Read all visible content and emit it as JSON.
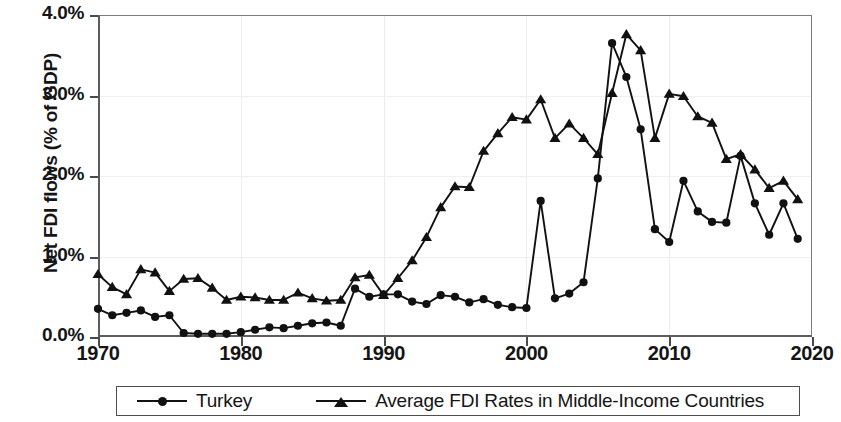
{
  "chart_data": {
    "type": "line",
    "title": "",
    "xlabel": "",
    "ylabel": "Net FDI flows (% of GDP)",
    "xlim": [
      1970,
      2020
    ],
    "ylim": [
      0.0,
      4.0
    ],
    "grid": true,
    "legend_position": "bottom",
    "y_tick_labels": [
      "0.0%",
      "1.0%",
      "2.0%",
      "3.0%",
      "4.0%"
    ],
    "y_ticks": [
      0.0,
      1.0,
      2.0,
      3.0,
      4.0
    ],
    "x_tick_labels": [
      "1970",
      "1980",
      "1990",
      "2000",
      "2010",
      "2020"
    ],
    "x_ticks": [
      1970,
      1980,
      1990,
      2000,
      2010,
      2020
    ],
    "x": [
      1970,
      1971,
      1972,
      1973,
      1974,
      1975,
      1976,
      1977,
      1978,
      1979,
      1980,
      1981,
      1982,
      1983,
      1984,
      1985,
      1986,
      1987,
      1988,
      1989,
      1990,
      1991,
      1992,
      1993,
      1994,
      1995,
      1996,
      1997,
      1998,
      1999,
      2000,
      2001,
      2002,
      2003,
      2004,
      2005,
      2006,
      2007,
      2008,
      2009,
      2010,
      2011,
      2012,
      2013,
      2014,
      2015,
      2016,
      2017,
      2018,
      2019
    ],
    "series": [
      {
        "name": "Turkey",
        "marker": "circle",
        "color": "#111111",
        "values": [
          0.35,
          0.27,
          0.3,
          0.33,
          0.25,
          0.27,
          0.05,
          0.04,
          0.04,
          0.04,
          0.06,
          0.09,
          0.12,
          0.11,
          0.14,
          0.17,
          0.18,
          0.14,
          0.6,
          0.5,
          0.53,
          0.53,
          0.44,
          0.41,
          0.52,
          0.5,
          0.43,
          0.47,
          0.4,
          0.37,
          0.36,
          1.69,
          0.48,
          0.54,
          0.68,
          1.97,
          3.65,
          3.23,
          2.58,
          1.34,
          1.18,
          1.94,
          1.56,
          1.43,
          1.42,
          2.25,
          1.66,
          1.27,
          1.66,
          1.22
        ]
      },
      {
        "name": "Average FDI Rates in Middle-Income Countries",
        "marker": "triangle",
        "color": "#111111",
        "values": [
          0.78,
          0.62,
          0.53,
          0.84,
          0.8,
          0.57,
          0.72,
          0.73,
          0.61,
          0.46,
          0.5,
          0.49,
          0.46,
          0.46,
          0.55,
          0.48,
          0.45,
          0.46,
          0.74,
          0.77,
          0.52,
          0.73,
          0.95,
          1.24,
          1.61,
          1.87,
          1.86,
          2.31,
          2.53,
          2.73,
          2.7,
          2.95,
          2.47,
          2.65,
          2.47,
          2.27,
          3.03,
          3.76,
          3.56,
          2.47,
          3.02,
          2.99,
          2.74,
          2.66,
          2.21,
          2.27,
          2.08,
          1.85,
          1.94,
          1.71
        ]
      }
    ]
  },
  "axis": {
    "y_title": "Net FDI flows (% of GDP)"
  },
  "legend": {
    "items": [
      {
        "label": "Turkey",
        "marker": "circle-marker-icon"
      },
      {
        "label": "Average FDI Rates in Middle-Income Countries",
        "marker": "triangle-marker-icon"
      }
    ]
  }
}
